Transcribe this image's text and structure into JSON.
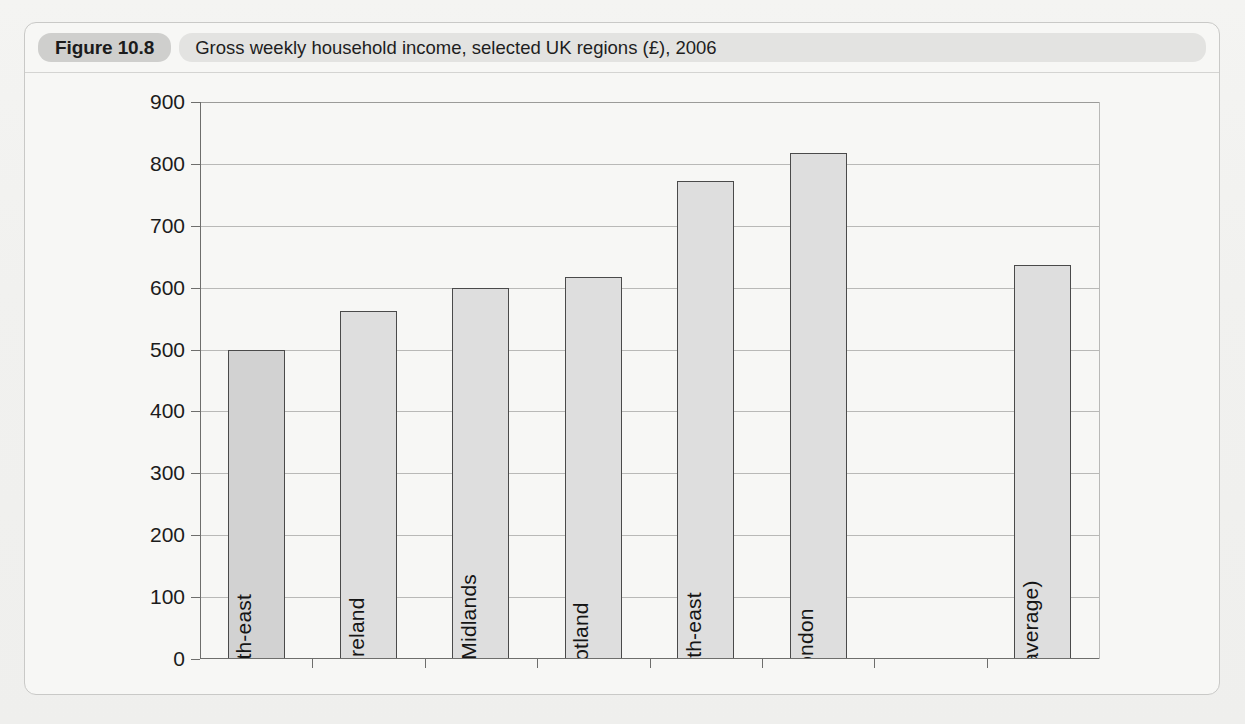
{
  "figure": {
    "badge": "Figure 10.8",
    "caption": "Gross weekly household income, selected UK regions (£), 2006"
  },
  "chart_data": {
    "type": "bar",
    "title": "Gross weekly household income, selected UK regions (£), 2006",
    "xlabel": "",
    "ylabel": "",
    "ylim": [
      0,
      900
    ],
    "ytick_step": 100,
    "yticks": [
      0,
      100,
      200,
      300,
      400,
      500,
      600,
      700,
      800,
      900
    ],
    "grid": true,
    "legend": "none",
    "categories": [
      "North-east",
      "N. Ireland",
      "West Midlands",
      "Scotland",
      "South-east",
      "London",
      "UK (average)"
    ],
    "values": [
      500,
      562,
      600,
      617,
      773,
      818,
      637
    ],
    "bar_fill": "#dedede",
    "bar_edge": "#4a4a4a",
    "slot_count": 8,
    "empty_slot_index": 6
  },
  "colors": {
    "page_background": "#f2f2f0",
    "frame_background": "#f7f7f5",
    "badge_background": "#cfcfcd",
    "caption_background": "#e3e3e1",
    "axis": "#6e6e6c",
    "gridline": "#b9b9b7",
    "text": "#1c1c1c"
  }
}
